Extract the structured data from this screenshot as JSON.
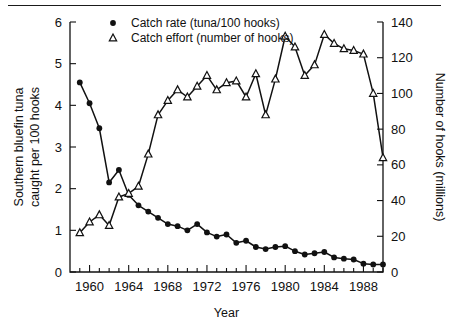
{
  "figure": {
    "has_top_rule": true,
    "background": "#ffffff",
    "ink_color": "#111111"
  },
  "chart_data": {
    "type": "line",
    "title": "",
    "xlabel": "Year",
    "ylabel": "Southern bluefin tuna caught per 100 hooks",
    "y2label": "Number of hooks (millions)",
    "grid": false,
    "legend_position": "top-left-inside",
    "xlim": [
      1958,
      1990
    ],
    "ylim": [
      0,
      6
    ],
    "y2lim": [
      0,
      140
    ],
    "xticks_major": [
      1960,
      1964,
      1968,
      1972,
      1976,
      1980,
      1984,
      1988
    ],
    "xticks_minor_step": 1,
    "yticks": [
      0,
      1,
      2,
      3,
      4,
      5,
      6
    ],
    "y2ticks": [
      0,
      20,
      40,
      60,
      80,
      100,
      120,
      140
    ],
    "x": [
      1959,
      1960,
      1961,
      1962,
      1963,
      1964,
      1965,
      1966,
      1967,
      1968,
      1969,
      1970,
      1971,
      1972,
      1973,
      1974,
      1975,
      1976,
      1977,
      1978,
      1979,
      1980,
      1981,
      1982,
      1983,
      1984,
      1985,
      1986,
      1987,
      1988,
      1989,
      1990
    ],
    "series": [
      {
        "name": "Catch rate (tuna/100 hooks)",
        "marker": "filled-circle",
        "axis": "left",
        "unit": "tuna per 100 hooks",
        "values": [
          4.55,
          4.05,
          3.45,
          2.15,
          2.45,
          1.85,
          1.6,
          1.45,
          1.3,
          1.15,
          1.1,
          1.0,
          1.15,
          0.95,
          0.85,
          0.9,
          0.7,
          0.75,
          0.6,
          0.55,
          0.6,
          0.62,
          0.5,
          0.42,
          0.45,
          0.48,
          0.35,
          0.32,
          0.3,
          0.2,
          0.18,
          0.18
        ]
      },
      {
        "name": "Catch effort (number of hooks)",
        "marker": "open-triangle",
        "axis": "right",
        "unit": "millions of hooks",
        "values": [
          22,
          28,
          32,
          26,
          42,
          44,
          48,
          66,
          88,
          96,
          102,
          98,
          104,
          110,
          102,
          106,
          107,
          98,
          111,
          88,
          108,
          132,
          126,
          110,
          116,
          133,
          128,
          125,
          124,
          122,
          100,
          64
        ]
      }
    ]
  }
}
